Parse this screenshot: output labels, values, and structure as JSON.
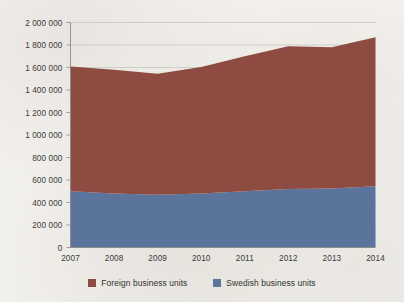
{
  "chart_data": {
    "type": "area",
    "stacked": true,
    "title": "",
    "subtitle": "",
    "xlabel": "",
    "ylabel": "",
    "categories": [
      "2007",
      "2008",
      "2009",
      "2010",
      "2011",
      "2012",
      "2013",
      "2014"
    ],
    "x": [
      2007,
      2008,
      2009,
      2010,
      2011,
      2012,
      2013,
      2014
    ],
    "series": [
      {
        "name": "Swedish business units",
        "color": "#5b749c",
        "values": [
          500000,
          480000,
          468000,
          480000,
          500000,
          520000,
          525000,
          545000
        ]
      },
      {
        "name": "Foreign business units",
        "color": "#8e4b42",
        "values": [
          1110000,
          1100000,
          1077000,
          1125000,
          1200000,
          1270000,
          1255000,
          1325000
        ]
      }
    ],
    "stack_totals": [
      1610000,
      1580000,
      1545000,
      1605000,
      1700000,
      1790000,
      1780000,
      1870000
    ],
    "ylim": [
      0,
      2000000
    ],
    "xlim": [
      2007,
      2014
    ],
    "ytick_values": [
      0,
      200000,
      400000,
      600000,
      800000,
      1000000,
      1200000,
      1400000,
      1600000,
      1800000,
      2000000
    ],
    "ytick_labels": [
      "0",
      "200 000",
      "400 000",
      "600 000",
      "800 000",
      "1 000 000",
      "1 200 000",
      "1 400 000",
      "1 600 000",
      "1 800 000",
      "2 000 000"
    ],
    "grid": true,
    "grid_axis": "y",
    "legend_position": "bottom",
    "legend": [
      {
        "label": "Foreign business units",
        "color": "#8e4b42"
      },
      {
        "label": "Swedish business units",
        "color": "#5b749c"
      }
    ]
  },
  "colors": {
    "foreign": "#8e4b42",
    "swedish": "#5b749c",
    "grid": "#c9c6c0",
    "axis": "#8d8a84",
    "background": "#f4f2ee",
    "text": "#3b3b3b"
  }
}
